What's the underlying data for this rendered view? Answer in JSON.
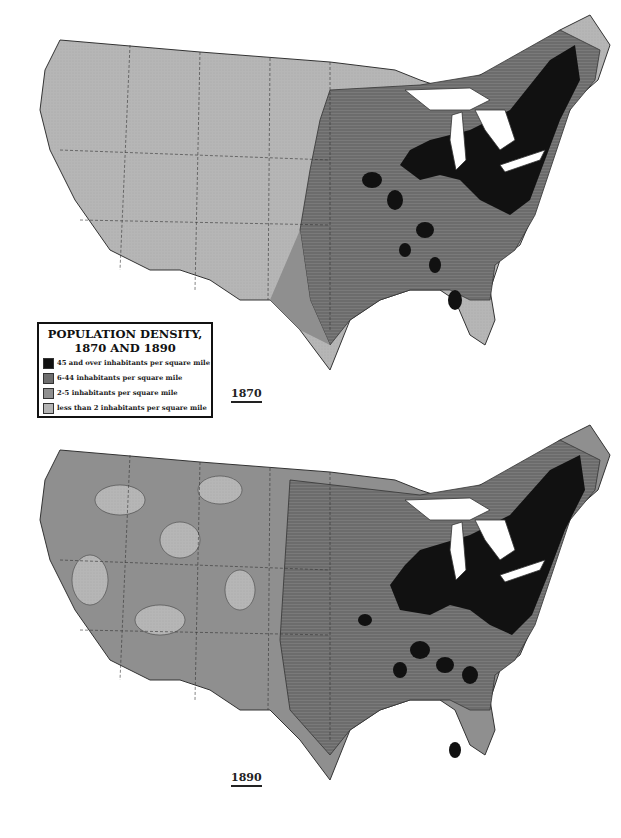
{
  "legend": {
    "title_line1": "POPULATION DENSITY,",
    "title_line2": "1870 AND 1890",
    "items": [
      {
        "label": "45 and over inhabitants per square mile",
        "color": "#111111"
      },
      {
        "label": "6-44 inhabitants per square mile",
        "color": "#6e6e6e"
      },
      {
        "label": "2-5  inhabitants per square mile",
        "color": "#8f8f8f"
      },
      {
        "label": "less than 2 inhabitants per square mile",
        "color": "#b4b4b4"
      }
    ]
  },
  "maps": [
    {
      "year": "1870"
    },
    {
      "year": "1890"
    }
  ],
  "colors": {
    "dense": "#111111",
    "medium": "#6e6e6e",
    "low": "#8f8f8f",
    "sparse": "#b4b4b4",
    "water": "#ffffff"
  }
}
